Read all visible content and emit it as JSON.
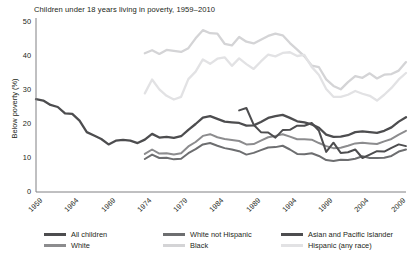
{
  "chart_data": {
    "type": "line",
    "title": "Children under 18 years living in poverty, 1959–2010",
    "xlabel": "",
    "ylabel": "Below poverty (%)",
    "xlim": [
      1959,
      2010
    ],
    "ylim": [
      0,
      50
    ],
    "ytick_labels": [
      "0",
      "10",
      "20",
      "30",
      "40",
      "50"
    ],
    "ytick_values": [
      0,
      10,
      20,
      30,
      40,
      50
    ],
    "xtick_labels": [
      "1959",
      "1964",
      "1969",
      "1974",
      "1979",
      "1984",
      "1989",
      "1994",
      "1999",
      "2004",
      "2009"
    ],
    "xtick_values": [
      1959,
      1964,
      1969,
      1974,
      1979,
      1984,
      1989,
      1994,
      1999,
      2004,
      2009
    ],
    "grid": false,
    "legend_position": "bottom",
    "series": [
      {
        "name": "All children",
        "color": "#4d4d4f",
        "width": 2.3,
        "x": [
          1959,
          1960,
          1961,
          1962,
          1963,
          1964,
          1965,
          1966,
          1967,
          1968,
          1969,
          1970,
          1971,
          1972,
          1973,
          1974,
          1975,
          1976,
          1977,
          1978,
          1979,
          1980,
          1981,
          1982,
          1983,
          1984,
          1985,
          1986,
          1987,
          1988,
          1989,
          1990,
          1991,
          1992,
          1993,
          1994,
          1995,
          1996,
          1997,
          1998,
          1999,
          2000,
          2001,
          2002,
          2003,
          2004,
          2005,
          2006,
          2007,
          2008,
          2009,
          2010
        ],
        "y": [
          27.3,
          26.9,
          25.6,
          25.0,
          23.1,
          23.0,
          21.0,
          17.6,
          16.6,
          15.6,
          14.0,
          15.1,
          15.3,
          15.1,
          14.4,
          15.4,
          17.1,
          16.0,
          16.2,
          15.9,
          16.4,
          18.3,
          20.0,
          21.9,
          22.3,
          21.5,
          20.7,
          20.5,
          20.3,
          19.5,
          19.6,
          20.6,
          21.8,
          22.3,
          22.7,
          21.8,
          20.8,
          20.5,
          19.9,
          18.9,
          16.9,
          16.2,
          16.3,
          16.7,
          17.6,
          17.8,
          17.6,
          17.4,
          18.0,
          19.0,
          20.7,
          22.0
        ]
      },
      {
        "name": "White",
        "color": "#8c8c8e",
        "width": 2.0,
        "x": [
          1974,
          1975,
          1976,
          1977,
          1978,
          1979,
          1980,
          1981,
          1982,
          1983,
          1984,
          1985,
          1986,
          1987,
          1988,
          1989,
          1990,
          1991,
          1992,
          1993,
          1994,
          1995,
          1996,
          1997,
          1998,
          1999,
          2000,
          2001,
          2002,
          2003,
          2004,
          2005,
          2006,
          2007,
          2008,
          2009,
          2010
        ],
        "y": [
          11.2,
          12.5,
          11.3,
          11.4,
          11.0,
          11.4,
          13.4,
          14.7,
          16.5,
          17.0,
          16.1,
          15.6,
          15.3,
          15.0,
          14.0,
          14.1,
          15.1,
          16.1,
          16.5,
          17.0,
          16.3,
          15.5,
          15.5,
          15.4,
          14.4,
          13.5,
          12.9,
          13.0,
          13.6,
          14.3,
          14.5,
          14.3,
          14.1,
          14.9,
          15.6,
          16.9,
          18.0
        ]
      },
      {
        "name": "White not Hispanic",
        "color": "#6d6e70",
        "width": 2.0,
        "x": [
          1974,
          1975,
          1976,
          1977,
          1978,
          1979,
          1980,
          1981,
          1982,
          1983,
          1984,
          1985,
          1986,
          1987,
          1988,
          1989,
          1990,
          1991,
          1992,
          1993,
          1994,
          1995,
          1996,
          1997,
          1998,
          1999,
          2000,
          2001,
          2002,
          2003,
          2004,
          2005,
          2006,
          2007,
          2008,
          2009,
          2010
        ],
        "y": [
          9.7,
          11.0,
          10.0,
          10.1,
          9.6,
          9.8,
          11.4,
          12.6,
          14.0,
          14.4,
          13.6,
          12.9,
          12.5,
          12.0,
          11.0,
          11.5,
          12.3,
          13.1,
          13.2,
          13.6,
          12.5,
          11.2,
          11.1,
          11.4,
          10.6,
          9.4,
          9.1,
          9.5,
          9.4,
          9.8,
          10.5,
          10.0,
          10.0,
          10.1,
          10.6,
          11.9,
          12.5
        ]
      },
      {
        "name": "Black",
        "color": "#d4d4d6",
        "width": 2.3,
        "x": [
          1974,
          1975,
          1976,
          1977,
          1978,
          1979,
          1980,
          1981,
          1982,
          1983,
          1984,
          1985,
          1986,
          1987,
          1988,
          1989,
          1990,
          1991,
          1992,
          1993,
          1994,
          1995,
          1996,
          1997,
          1998,
          1999,
          2000,
          2001,
          2002,
          2003,
          2004,
          2005,
          2006,
          2007,
          2008,
          2009,
          2010
        ],
        "y": [
          40.8,
          41.7,
          40.6,
          41.8,
          41.5,
          41.2,
          42.3,
          45.2,
          47.6,
          46.7,
          46.6,
          43.6,
          43.1,
          45.6,
          44.2,
          43.7,
          44.8,
          45.9,
          46.6,
          46.1,
          43.8,
          41.9,
          39.9,
          37.2,
          36.7,
          33.1,
          31.2,
          30.2,
          32.3,
          34.1,
          33.6,
          34.9,
          33.4,
          34.5,
          34.7,
          35.7,
          38.2
        ]
      },
      {
        "name": "Asian and Pacific Islander",
        "color": "#4d4d4f",
        "width": 2.0,
        "x": [
          1987,
          1988,
          1989,
          1990,
          1991,
          1992,
          1993,
          1994,
          1995,
          1996,
          1997,
          1998,
          1999,
          2000,
          2001,
          2002,
          2003,
          2004,
          2005,
          2006,
          2007,
          2008,
          2009,
          2010
        ],
        "y": [
          24.0,
          24.7,
          19.8,
          17.6,
          17.5,
          16.0,
          18.2,
          18.3,
          19.5,
          19.5,
          20.3,
          18.0,
          11.8,
          14.5,
          11.5,
          11.7,
          12.5,
          10.0,
          11.0,
          12.0,
          11.9,
          13.0,
          14.0,
          13.5
        ]
      },
      {
        "name": "Hispanic (any race)",
        "color": "#e2e2e4",
        "width": 2.3,
        "x": [
          1974,
          1975,
          1976,
          1977,
          1978,
          1979,
          1980,
          1981,
          1982,
          1983,
          1984,
          1985,
          1986,
          1987,
          1988,
          1989,
          1990,
          1991,
          1992,
          1993,
          1994,
          1995,
          1996,
          1997,
          1998,
          1999,
          2000,
          2001,
          2002,
          2003,
          2004,
          2005,
          2006,
          2007,
          2008,
          2009,
          2010
        ],
        "y": [
          29.0,
          33.1,
          30.2,
          28.3,
          27.2,
          28.0,
          33.2,
          35.4,
          39.0,
          37.7,
          39.2,
          39.6,
          37.1,
          39.3,
          37.6,
          36.2,
          38.4,
          40.4,
          39.9,
          40.9,
          41.1,
          40.0,
          40.3,
          36.8,
          34.4,
          30.3,
          28.0,
          28.0,
          28.6,
          29.7,
          28.9,
          28.3,
          26.9,
          28.6,
          30.6,
          33.1,
          35.0
        ]
      }
    ]
  },
  "axis": {
    "line_color": "#808083"
  }
}
